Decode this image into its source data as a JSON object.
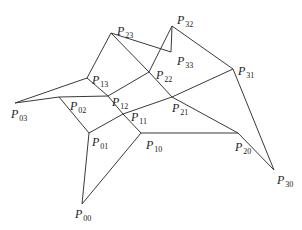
{
  "diagram": {
    "type": "control-net",
    "stroke_color": "#3a3a3a",
    "points": [
      {
        "id": "P00",
        "name": "P",
        "sub": "00",
        "x": 82,
        "y": 204,
        "lx": 75,
        "ly": 208
      },
      {
        "id": "P01",
        "name": "P",
        "sub": "01",
        "x": 89,
        "y": 133,
        "lx": 92,
        "ly": 136
      },
      {
        "id": "P02",
        "name": "P",
        "sub": "02",
        "x": 59,
        "y": 97,
        "lx": 70,
        "ly": 100
      },
      {
        "id": "P03",
        "name": "P",
        "sub": "03",
        "x": 15,
        "y": 103,
        "lx": 11,
        "ly": 108
      },
      {
        "id": "P10",
        "name": "P",
        "sub": "10",
        "x": 141,
        "y": 133,
        "lx": 146,
        "ly": 139
      },
      {
        "id": "P11",
        "name": "P",
        "sub": "11",
        "x": 123,
        "y": 114,
        "lx": 131,
        "ly": 111
      },
      {
        "id": "P12",
        "name": "P",
        "sub": "12",
        "x": 108,
        "y": 96,
        "lx": 112,
        "ly": 96
      },
      {
        "id": "P13",
        "name": "P",
        "sub": "13",
        "x": 87,
        "y": 78,
        "lx": 92,
        "ly": 74
      },
      {
        "id": "P20",
        "name": "P",
        "sub": "20",
        "x": 238,
        "y": 133,
        "lx": 235,
        "ly": 141
      },
      {
        "id": "P21",
        "name": "P",
        "sub": "21",
        "x": 172,
        "y": 97,
        "lx": 172,
        "ly": 102
      },
      {
        "id": "P22",
        "name": "P",
        "sub": "22",
        "x": 149,
        "y": 72,
        "lx": 156,
        "ly": 69
      },
      {
        "id": "P23",
        "name": "P",
        "sub": "23",
        "x": 111,
        "y": 33,
        "lx": 117,
        "ly": 25
      },
      {
        "id": "P30",
        "name": "P",
        "sub": "30",
        "x": 274,
        "y": 170,
        "lx": 277,
        "ly": 174
      },
      {
        "id": "P31",
        "name": "P",
        "sub": "31",
        "x": 233,
        "y": 69,
        "lx": 238,
        "ly": 65
      },
      {
        "id": "P32",
        "name": "P",
        "sub": "32",
        "x": 172,
        "y": 26,
        "lx": 177,
        "ly": 14
      },
      {
        "id": "P33",
        "name": "P",
        "sub": "33",
        "x": 171,
        "y": 52,
        "lx": 177,
        "ly": 55
      }
    ],
    "edges": [
      [
        "P00",
        "P01"
      ],
      [
        "P01",
        "P02"
      ],
      [
        "P02",
        "P03"
      ],
      [
        "P10",
        "P11"
      ],
      [
        "P11",
        "P12"
      ],
      [
        "P12",
        "P13"
      ],
      [
        "P20",
        "P21"
      ],
      [
        "P21",
        "P22"
      ],
      [
        "P22",
        "P23"
      ],
      [
        "P30",
        "P31"
      ],
      [
        "P31",
        "P32"
      ],
      [
        "P32",
        "P33"
      ],
      [
        "P00",
        "P10"
      ],
      [
        "P10",
        "P20"
      ],
      [
        "P20",
        "P30"
      ],
      [
        "P01",
        "P11"
      ],
      [
        "P11",
        "P21"
      ],
      [
        "P21",
        "P31"
      ],
      [
        "P02",
        "P12"
      ],
      [
        "P12",
        "P22"
      ],
      [
        "P22",
        "P32"
      ],
      [
        "P03",
        "P13"
      ],
      [
        "P13",
        "P23"
      ],
      [
        "P23",
        "P33"
      ]
    ]
  }
}
